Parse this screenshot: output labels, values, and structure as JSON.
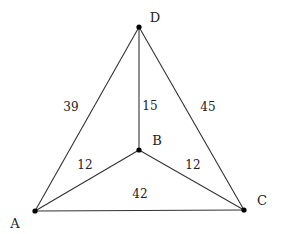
{
  "diagram": {
    "type": "weighted-graph",
    "nodes": [
      {
        "id": "A",
        "label": "A",
        "x": 35,
        "y": 211,
        "lx": 15,
        "ly": 228
      },
      {
        "id": "B",
        "label": "B",
        "x": 139,
        "y": 150,
        "lx": 157,
        "ly": 145
      },
      {
        "id": "C",
        "label": "C",
        "x": 244,
        "y": 210,
        "lx": 262,
        "ly": 205
      },
      {
        "id": "D",
        "label": "D",
        "x": 139,
        "y": 27,
        "lx": 155,
        "ly": 22
      }
    ],
    "edges": [
      {
        "from": "A",
        "to": "D",
        "weight": "39",
        "wx": 71,
        "wy": 111
      },
      {
        "from": "B",
        "to": "D",
        "weight": "15",
        "wx": 150,
        "wy": 110
      },
      {
        "from": "C",
        "to": "D",
        "weight": "45",
        "wx": 208,
        "wy": 111
      },
      {
        "from": "A",
        "to": "B",
        "weight": "12",
        "wx": 85,
        "wy": 169
      },
      {
        "from": "B",
        "to": "C",
        "weight": "12",
        "wx": 193,
        "wy": 169
      },
      {
        "from": "A",
        "to": "C",
        "weight": "42",
        "wx": 140,
        "wy": 198
      }
    ]
  }
}
